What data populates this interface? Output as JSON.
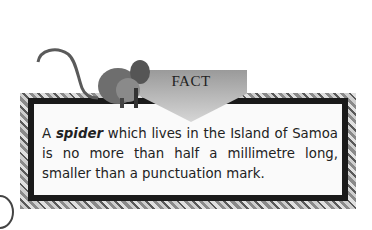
{
  "banner": {
    "label": "FACT"
  },
  "fact": {
    "prefix": "A ",
    "emphasis": "spider",
    "suffix": " which lives in the Island of Samoa is no more than half a millimetre long, smaller than a punctuation mark."
  },
  "colors": {
    "frame_border": "#1a1a1a",
    "banner": "#b0b0b0",
    "text": "#222222"
  }
}
